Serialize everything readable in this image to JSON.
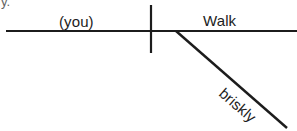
{
  "canvas": {
    "width": 297,
    "height": 131,
    "background_color": "#ffffff",
    "ink_color": "#1c1c1c"
  },
  "diagram": {
    "type": "reed-kellogg-sentence-diagram",
    "sentence": "(you) Walk briskly",
    "baseline": {
      "x1": 6,
      "y1": 31,
      "x2": 297,
      "y2": 31,
      "stroke_width": 2.2
    },
    "subject_verb_divider": {
      "x1": 151,
      "y1": 5,
      "x2": 151,
      "y2": 53,
      "stroke_width": 2.2
    },
    "modifier_slant": {
      "x1": 176,
      "y1": 31,
      "x2": 287,
      "y2": 128,
      "stroke_width": 2.4
    },
    "labels": {
      "subject": {
        "text": "(you)",
        "x": 59,
        "y": 27,
        "font_size": 15,
        "role": "implied-subject"
      },
      "verb": {
        "text": "Walk",
        "x": 203,
        "y": 26,
        "font_size": 16,
        "role": "predicate-verb"
      },
      "adverb": {
        "text": "briskly",
        "x": 218,
        "y": 95,
        "font_size": 15,
        "rotation_degrees": 41,
        "role": "adverb-modifier"
      }
    },
    "artifact_mark": {
      "text": "y.",
      "x": 1,
      "y": 6,
      "note": "clipped ink from line above"
    }
  }
}
